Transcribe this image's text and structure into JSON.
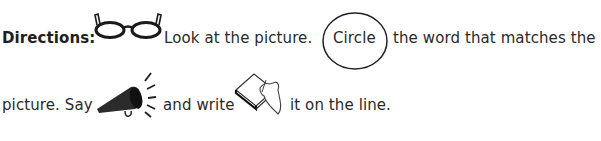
{
  "directions": {
    "label": "Directions:",
    "line1": {
      "part1": "Look at the picture.",
      "circled_word": "Circle",
      "part2": "the word that matches the"
    },
    "line2": {
      "part1": "picture.  Say",
      "part2": "and write",
      "part3": "it on the line."
    }
  },
  "icons": {
    "glasses": "glasses-icon",
    "megaphone": "megaphone-icon",
    "writing": "hand-writing-book-icon"
  }
}
